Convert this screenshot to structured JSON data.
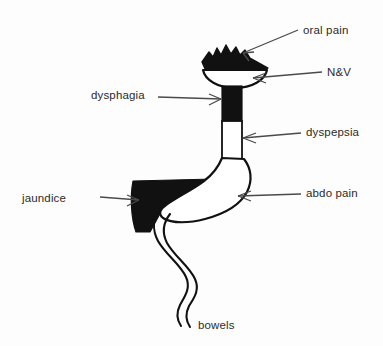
{
  "figure": {
    "background_color": "#fdfdfd",
    "ink_color": "#111111",
    "label_color": "#2b2b2b",
    "width": 383,
    "height": 346
  },
  "labels": {
    "oral_pain": "oral pain",
    "nausea_vomiting": "N&V",
    "dysphagia": "dysphagia",
    "dyspepsia": "dyspepsia",
    "jaundice": "jaundice",
    "abdo_pain": "abdo pain",
    "bowels": "bowels"
  },
  "anatomy": [
    {
      "name": "mouth-cap",
      "fill": "black",
      "description": "jagged black cap over mouth"
    },
    {
      "name": "mouth-bowl",
      "fill": "white",
      "description": "white bowl outline below cap"
    },
    {
      "name": "upper-esophagus",
      "fill": "black",
      "description": "solid black upper esophagus tube"
    },
    {
      "name": "lower-esophagus",
      "fill": "white",
      "description": "white outlined lower esophagus tube"
    },
    {
      "name": "stomach",
      "fill": "white",
      "description": "white outlined stomach body"
    },
    {
      "name": "liver",
      "fill": "black",
      "description": "solid black liver wedge left of stomach"
    },
    {
      "name": "bowel",
      "fill": "white",
      "description": "wavy double-line intestine descending"
    }
  ],
  "annotations": [
    {
      "name": "oral-pain",
      "points_to": "mouth-cap",
      "direction": "down-left"
    },
    {
      "name": "nausea-vomiting",
      "points_to": "mouth-bowl",
      "direction": "left"
    },
    {
      "name": "dysphagia",
      "points_to": "upper-esophagus",
      "direction": "right"
    },
    {
      "name": "dyspepsia",
      "points_to": "lower-esophagus",
      "direction": "left"
    },
    {
      "name": "jaundice",
      "points_to": "liver",
      "direction": "right"
    },
    {
      "name": "abdo-pain",
      "points_to": "stomach",
      "direction": "left"
    },
    {
      "name": "bowels",
      "points_to": "bowel",
      "direction": "up"
    }
  ]
}
